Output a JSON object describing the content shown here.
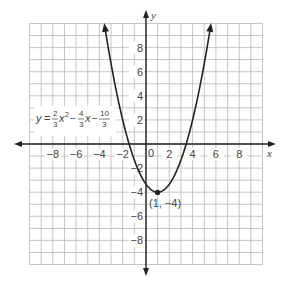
{
  "chart_data": {
    "type": "line",
    "title": "",
    "equation_label": {
      "y": "y",
      "eq": "=",
      "a_num": "2",
      "a_den": "3",
      "x2": "x",
      "exp": "2",
      "minus1": "−",
      "b_num": "4",
      "b_den": "3",
      "x1": "x",
      "minus2": "−",
      "c_num": "10",
      "c_den": "3"
    },
    "function": "y = (2/3)x^2 - (4/3)x - 10/3",
    "vertex": {
      "x": 1,
      "y": -4,
      "label": "(1, −4)"
    },
    "xlabel": "x",
    "ylabel": "y",
    "xlim": [
      -10,
      10
    ],
    "ylim": [
      -10,
      10
    ],
    "grid": true,
    "x_ticks": [
      "-8",
      "-6",
      "-4",
      "-2",
      "0",
      "2",
      "4",
      "6",
      "8"
    ],
    "y_ticks": [
      "8",
      "6",
      "4",
      "2",
      "-2",
      "-4",
      "-6",
      "-8"
    ],
    "series": [
      {
        "name": "parabola",
        "x": [
          -3.5,
          -2,
          -1,
          0,
          1,
          2,
          3,
          4,
          5.5
        ],
        "y": [
          9.5,
          2,
          -1.33,
          -3.33,
          -4,
          -3.33,
          -1.33,
          2,
          9.5
        ]
      }
    ]
  },
  "labels": {
    "x_axis": "x",
    "y_axis": "y",
    "origin": "0",
    "vertex": "(1, −4)",
    "xt": [
      "−8",
      "−6",
      "−4",
      "−2",
      "2",
      "4",
      "6",
      "8"
    ],
    "yt": [
      "8",
      "6",
      "4",
      "2",
      "−2",
      "−4",
      "−6",
      "−8"
    ]
  }
}
